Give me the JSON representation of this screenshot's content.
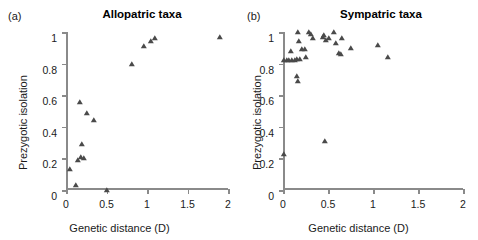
{
  "figure": {
    "background_color": "#ffffff",
    "marker_color": "#4a4a4a",
    "axis_color": "#8a8a8a"
  },
  "panels": [
    {
      "label": "(a)",
      "title": "Allopatric taxa",
      "xlabel": "Genetic distance (D)",
      "ylabel": "Prezygotic isolation"
    },
    {
      "label": "(b)",
      "title": "Sympatric taxa",
      "xlabel": "Genetic distance (D)",
      "ylabel": "Prezygotic isolation"
    }
  ],
  "chart_data": [
    {
      "type": "scatter",
      "title": "Allopatric taxa",
      "panel": "(a)",
      "xlabel": "Genetic distance (D)",
      "ylabel": "Prezygotic isolation",
      "xlim": [
        0,
        2
      ],
      "ylim": [
        0,
        1
      ],
      "xticks": [
        0,
        0.5,
        1,
        1.5,
        2
      ],
      "xticklabels": [
        "0",
        "0.5",
        "1",
        "1.5",
        "2"
      ],
      "yticks": [
        0,
        0.2,
        0.4,
        0.6,
        0.8,
        1
      ],
      "yticklabels": [
        "0",
        "0.2",
        "0.4",
        "0.6",
        "0.8",
        "1"
      ],
      "grid": false,
      "legend": null,
      "marker": "triangle",
      "points": [
        {
          "x": 0.05,
          "y": 0.13
        },
        {
          "x": 0.12,
          "y": 0.03
        },
        {
          "x": 0.15,
          "y": 0.19
        },
        {
          "x": 0.19,
          "y": 0.21
        },
        {
          "x": 0.2,
          "y": 0.29
        },
        {
          "x": 0.22,
          "y": 0.2
        },
        {
          "x": 0.17,
          "y": 0.56
        },
        {
          "x": 0.26,
          "y": 0.49
        },
        {
          "x": 0.35,
          "y": 0.44
        },
        {
          "x": 0.5,
          "y": 0.0
        },
        {
          "x": 0.82,
          "y": 0.8
        },
        {
          "x": 0.96,
          "y": 0.91
        },
        {
          "x": 1.05,
          "y": 0.94
        },
        {
          "x": 1.1,
          "y": 0.96
        },
        {
          "x": 1.9,
          "y": 0.97
        }
      ]
    },
    {
      "type": "scatter",
      "title": "Sympatric taxa",
      "panel": "(b)",
      "xlabel": "Genetic distance (D)",
      "ylabel": "Prezygotic isolation",
      "xlim": [
        0,
        2
      ],
      "ylim": [
        0,
        1
      ],
      "xticks": [
        0,
        0.5,
        1,
        1.5,
        2
      ],
      "xticklabels": [
        "0",
        "0.5",
        "1",
        "1.5",
        "2"
      ],
      "yticks": [
        0,
        0.2,
        0.4,
        0.6,
        0.8,
        1
      ],
      "yticklabels": [
        "0",
        "0.2",
        "0.4",
        "0.6",
        "0.8",
        "1"
      ],
      "grid": false,
      "legend": null,
      "marker": "triangle",
      "points": [
        {
          "x": 0.01,
          "y": 0.23
        },
        {
          "x": 0.01,
          "y": 0.82
        },
        {
          "x": 0.04,
          "y": 0.82
        },
        {
          "x": 0.07,
          "y": 0.82
        },
        {
          "x": 0.09,
          "y": 0.88
        },
        {
          "x": 0.1,
          "y": 0.82
        },
        {
          "x": 0.13,
          "y": 0.82
        },
        {
          "x": 0.15,
          "y": 0.83
        },
        {
          "x": 0.16,
          "y": 0.72
        },
        {
          "x": 0.17,
          "y": 1.0
        },
        {
          "x": 0.17,
          "y": 0.69
        },
        {
          "x": 0.18,
          "y": 0.94
        },
        {
          "x": 0.19,
          "y": 0.83
        },
        {
          "x": 0.21,
          "y": 0.89
        },
        {
          "x": 0.24,
          "y": 0.89
        },
        {
          "x": 0.26,
          "y": 0.84
        },
        {
          "x": 0.29,
          "y": 1.0
        },
        {
          "x": 0.31,
          "y": 0.99
        },
        {
          "x": 0.33,
          "y": 0.96
        },
        {
          "x": 0.44,
          "y": 0.97
        },
        {
          "x": 0.46,
          "y": 0.98
        },
        {
          "x": 0.47,
          "y": 0.31
        },
        {
          "x": 0.48,
          "y": 0.95
        },
        {
          "x": 0.51,
          "y": 0.96
        },
        {
          "x": 0.57,
          "y": 1.0
        },
        {
          "x": 0.59,
          "y": 0.93
        },
        {
          "x": 0.62,
          "y": 0.87
        },
        {
          "x": 0.64,
          "y": 0.86
        },
        {
          "x": 0.65,
          "y": 0.96
        },
        {
          "x": 0.75,
          "y": 0.9
        },
        {
          "x": 1.05,
          "y": 0.92
        },
        {
          "x": 1.17,
          "y": 0.84
        }
      ]
    }
  ]
}
